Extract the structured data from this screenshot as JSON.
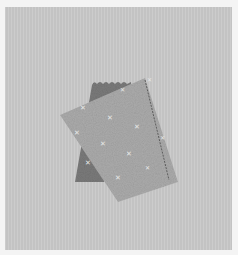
{
  "image": {
    "description": "Two pieces of fabric on a gray background: a dark pinked-edge fabric partially covered by a light speckled fabric with a stitched seam",
    "colors": {
      "frame": "#f4f4f4",
      "backdrop": "#c9c9c9",
      "dark_fabric": "#7d7d7d",
      "light_fabric": "#a9a9a9",
      "stitch": "#4a4a4a",
      "speckle": "#e6e6e6"
    },
    "objects": [
      {
        "name": "dark-fabric-piece",
        "edge": "pinked"
      },
      {
        "name": "light-fabric-piece",
        "pattern": "speckled crosses",
        "detail": "stitched seam along right edge"
      }
    ]
  }
}
